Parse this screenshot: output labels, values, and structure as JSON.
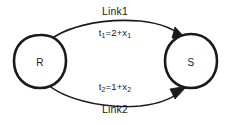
{
  "diagram": {
    "type": "network-link-diagram",
    "background_color": "#ffffff",
    "stroke_color": "#1a1a1a",
    "nodes": [
      {
        "id": "R",
        "label": "R",
        "position": "left",
        "shape": "circle"
      },
      {
        "id": "S",
        "label": "S",
        "position": "right",
        "shape": "circle"
      }
    ],
    "edges": [
      {
        "id": "link1",
        "name": "Link1",
        "from": "R",
        "to": "S",
        "direction": "R-to-S",
        "curve": "upper-arc",
        "arrowhead": "at-S",
        "label": "Link1",
        "formula_text": "t1=2+x1",
        "formula": {
          "lhs": "t",
          "lhs_sub": "1",
          "equals": "=",
          "constant": "2",
          "plus": "+",
          "variable": "x",
          "variable_sub": "1"
        }
      },
      {
        "id": "link2",
        "name": "Link2",
        "from": "R",
        "to": "S",
        "direction": "R-to-S",
        "curve": "lower-arc",
        "arrowhead": "at-S",
        "label": "Link2",
        "formula_text": "t2=1+x2",
        "formula": {
          "lhs": "t",
          "lhs_sub": "2",
          "equals": "=",
          "constant": "1",
          "plus": "+",
          "variable": "x",
          "variable_sub": "2"
        }
      }
    ]
  }
}
